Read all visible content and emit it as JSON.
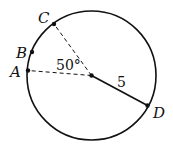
{
  "diagram": {
    "type": "circle-geometry",
    "circle": {
      "radius_label": "5"
    },
    "points": {
      "A": "A",
      "B": "B",
      "C": "C",
      "D": "D"
    },
    "angle_label": "50°",
    "radius_label": "5",
    "colors": {
      "stroke": "#111111",
      "background": "#ffffff"
    }
  }
}
